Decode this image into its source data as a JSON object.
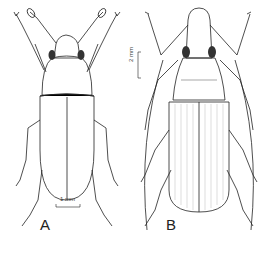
{
  "figure": {
    "panels": [
      {
        "label": "A",
        "scale_bar": "1 mm",
        "subject": "beetle-dorsal-view"
      },
      {
        "label": "B",
        "scale_bar": "2 mm",
        "subject": "weevil-dorsal-view"
      }
    ],
    "colors": {
      "ink": "#222222",
      "background": "#ffffff",
      "eye": "#333333"
    }
  }
}
